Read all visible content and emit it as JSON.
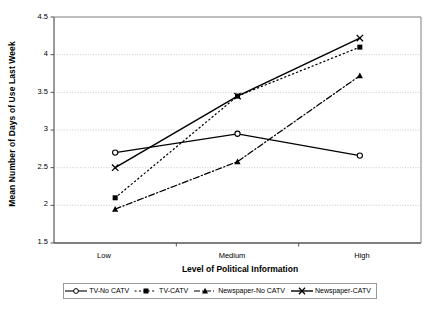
{
  "chart_data": {
    "type": "line",
    "title": "",
    "xlabel": "Level of Political Information",
    "ylabel": "Mean Number of Days of Use Last Week",
    "categories": [
      "Low",
      "Medium",
      "High"
    ],
    "xtick_labels": [
      "Low",
      "Medium",
      "High"
    ],
    "ytick_labels": [
      "1.5",
      "2",
      "2.5",
      "3",
      "3.5",
      "4",
      "4.5"
    ],
    "ylim": [
      1.5,
      4.5
    ],
    "ytick_values": [
      1.5,
      2,
      2.5,
      3,
      3.5,
      4,
      4.5
    ],
    "grid": "horizontal-dotted",
    "legend_position": "bottom",
    "series": [
      {
        "name": "TV-No CATV",
        "marker": "open-circle",
        "line_style": "solid",
        "color": "#000000",
        "values": [
          2.7,
          2.95,
          2.66
        ]
      },
      {
        "name": "TV-CATV",
        "marker": "filled-square",
        "line_style": "dotted",
        "color": "#000000",
        "values": [
          2.1,
          3.45,
          4.1
        ]
      },
      {
        "name": "Newspaper-No CATV",
        "marker": "filled-triangle",
        "line_style": "dash-dot",
        "color": "#000000",
        "values": [
          1.95,
          2.58,
          3.72
        ]
      },
      {
        "name": "Newspaper-CATV",
        "marker": "cross-x",
        "line_style": "solid",
        "color": "#000000",
        "values": [
          2.5,
          3.45,
          4.22
        ]
      }
    ]
  },
  "legend": {
    "items": [
      {
        "label": "TV-No CATV"
      },
      {
        "label": "TV-CATV"
      },
      {
        "label": "Newspaper-No CATV"
      },
      {
        "label": "Newspaper-CATV"
      }
    ]
  }
}
